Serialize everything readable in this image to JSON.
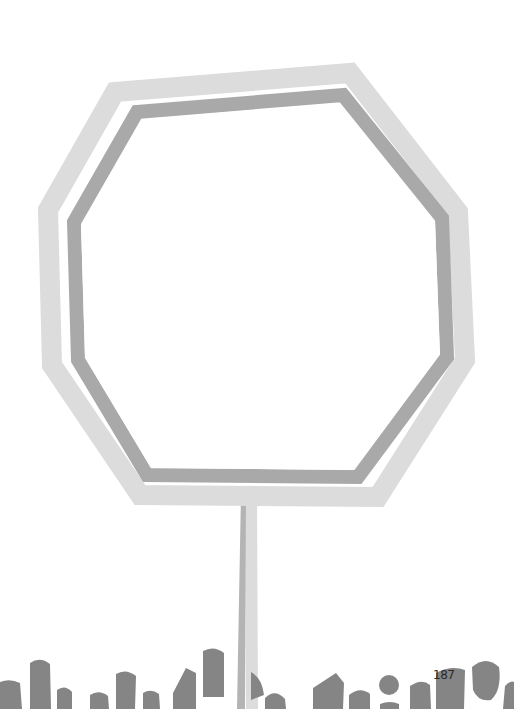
{
  "page": {
    "number": "187"
  },
  "illustration": {
    "subject": "octagon-sign-outline-on-post",
    "colors": {
      "background": "#ffffff",
      "outer_frame": "#dcdcdc",
      "inner_frame": "#a9a9a9",
      "post_light": "#dadada",
      "post_dark": "#b4b4b4",
      "grass": "#858585"
    }
  }
}
